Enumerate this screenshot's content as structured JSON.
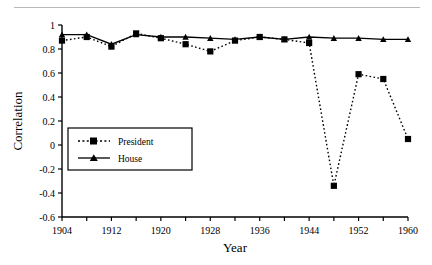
{
  "chart_data": {
    "type": "line",
    "title": "",
    "xlabel": "Year",
    "ylabel": "Correlation",
    "xlim": [
      1904,
      1960
    ],
    "ylim": [
      -0.6,
      1.0
    ],
    "grid": false,
    "legend_position": "center-left",
    "x_ticks_major": [
      1904,
      1912,
      1920,
      1928,
      1936,
      1944,
      1952,
      1960
    ],
    "x_tick_labels": [
      "1904",
      "1912",
      "1920",
      "1928",
      "1936",
      "1944",
      "1952",
      "1960"
    ],
    "x_ticks_minor": [
      1908,
      1916,
      1924,
      1932,
      1940,
      1948,
      1956
    ],
    "y_ticks": [
      1,
      0.8,
      0.6,
      0.4,
      0.2,
      0,
      -0.2,
      -0.4,
      -0.6
    ],
    "y_tick_labels": [
      "1",
      "0.8",
      "0.6",
      "0.4",
      "0.2",
      "0",
      "-0.2",
      "-0.4",
      "-0.6"
    ],
    "x": [
      1904,
      1908,
      1912,
      1916,
      1920,
      1924,
      1928,
      1932,
      1936,
      1940,
      1944,
      1948,
      1952,
      1956,
      1960
    ],
    "series": [
      {
        "name": "President",
        "marker": "square",
        "linestyle": "dotted",
        "color": "#000000",
        "values": [
          0.87,
          0.9,
          0.82,
          0.93,
          0.89,
          0.84,
          0.78,
          0.87,
          0.9,
          0.88,
          0.85,
          -0.34,
          0.59,
          0.55,
          0.05
        ]
      },
      {
        "name": "House",
        "marker": "triangle",
        "linestyle": "solid",
        "color": "#000000",
        "values": [
          0.92,
          0.92,
          0.84,
          0.92,
          0.9,
          0.9,
          0.89,
          0.88,
          0.9,
          0.88,
          0.9,
          0.89,
          0.89,
          0.88,
          0.88
        ]
      }
    ]
  },
  "legend": {
    "items": [
      {
        "label": "President"
      },
      {
        "label": "House"
      }
    ]
  },
  "axes": {
    "x_title": "Year",
    "y_title": "Correlation"
  }
}
